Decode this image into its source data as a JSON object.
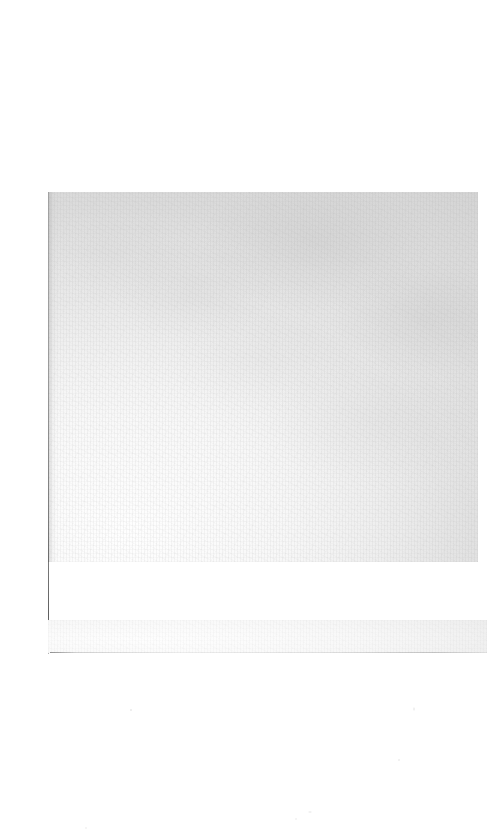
{
  "document": {
    "type": "scanned-page",
    "title": "",
    "body_text": "",
    "content_note": "blank page — no visible text or figures",
    "page_number": ""
  },
  "canvas": {
    "width": 493,
    "height": 836,
    "background_color": "#ffffff"
  },
  "regions": {
    "main_block": {
      "label": "scanned page area",
      "x": 48,
      "y": 192,
      "width": 430,
      "height": 370,
      "base_color": "#e9e9e9",
      "light_color": "#f7f7f7",
      "dark_color": "#e2e2e2"
    },
    "gutter_shadow": {
      "label": "spine gutter shadow",
      "x": 48,
      "y": 192,
      "width": 9,
      "height": 370,
      "color": "#787878"
    },
    "gutter_rule": {
      "label": "left edge rule",
      "x": 48,
      "y": 192,
      "width": 1,
      "height": 462,
      "color": "#3a3a3a"
    },
    "footer_band": {
      "label": "lower scanned band",
      "x": 48,
      "y": 620,
      "width": 439,
      "height": 33,
      "base_color": "#f5f5f5"
    },
    "footer_rule": {
      "label": "lower band bottom rule",
      "x": 50,
      "y": 652,
      "width": 437,
      "height": 1,
      "color": "#3c3c3c"
    },
    "white_gap": {
      "label": "white gap between blocks",
      "x": 48,
      "y": 562,
      "width": 430,
      "height": 58,
      "color": "#ffffff"
    }
  }
}
